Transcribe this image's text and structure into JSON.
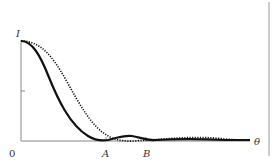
{
  "diagram": {
    "y_axis_label": "I",
    "x_axis_label": "θ",
    "origin_label": "0",
    "marker_a": "A",
    "marker_b": "B",
    "curves": [
      {
        "name": "solid-curve",
        "style": "solid",
        "description": "narrower central peak, first minimum at A"
      },
      {
        "name": "dotted-curve",
        "style": "dotted",
        "description": "wider central peak, first minimum at B"
      }
    ],
    "colors": {
      "axis": "#888888",
      "curve": "#111111",
      "text": "#333333",
      "border": "#999999"
    }
  }
}
